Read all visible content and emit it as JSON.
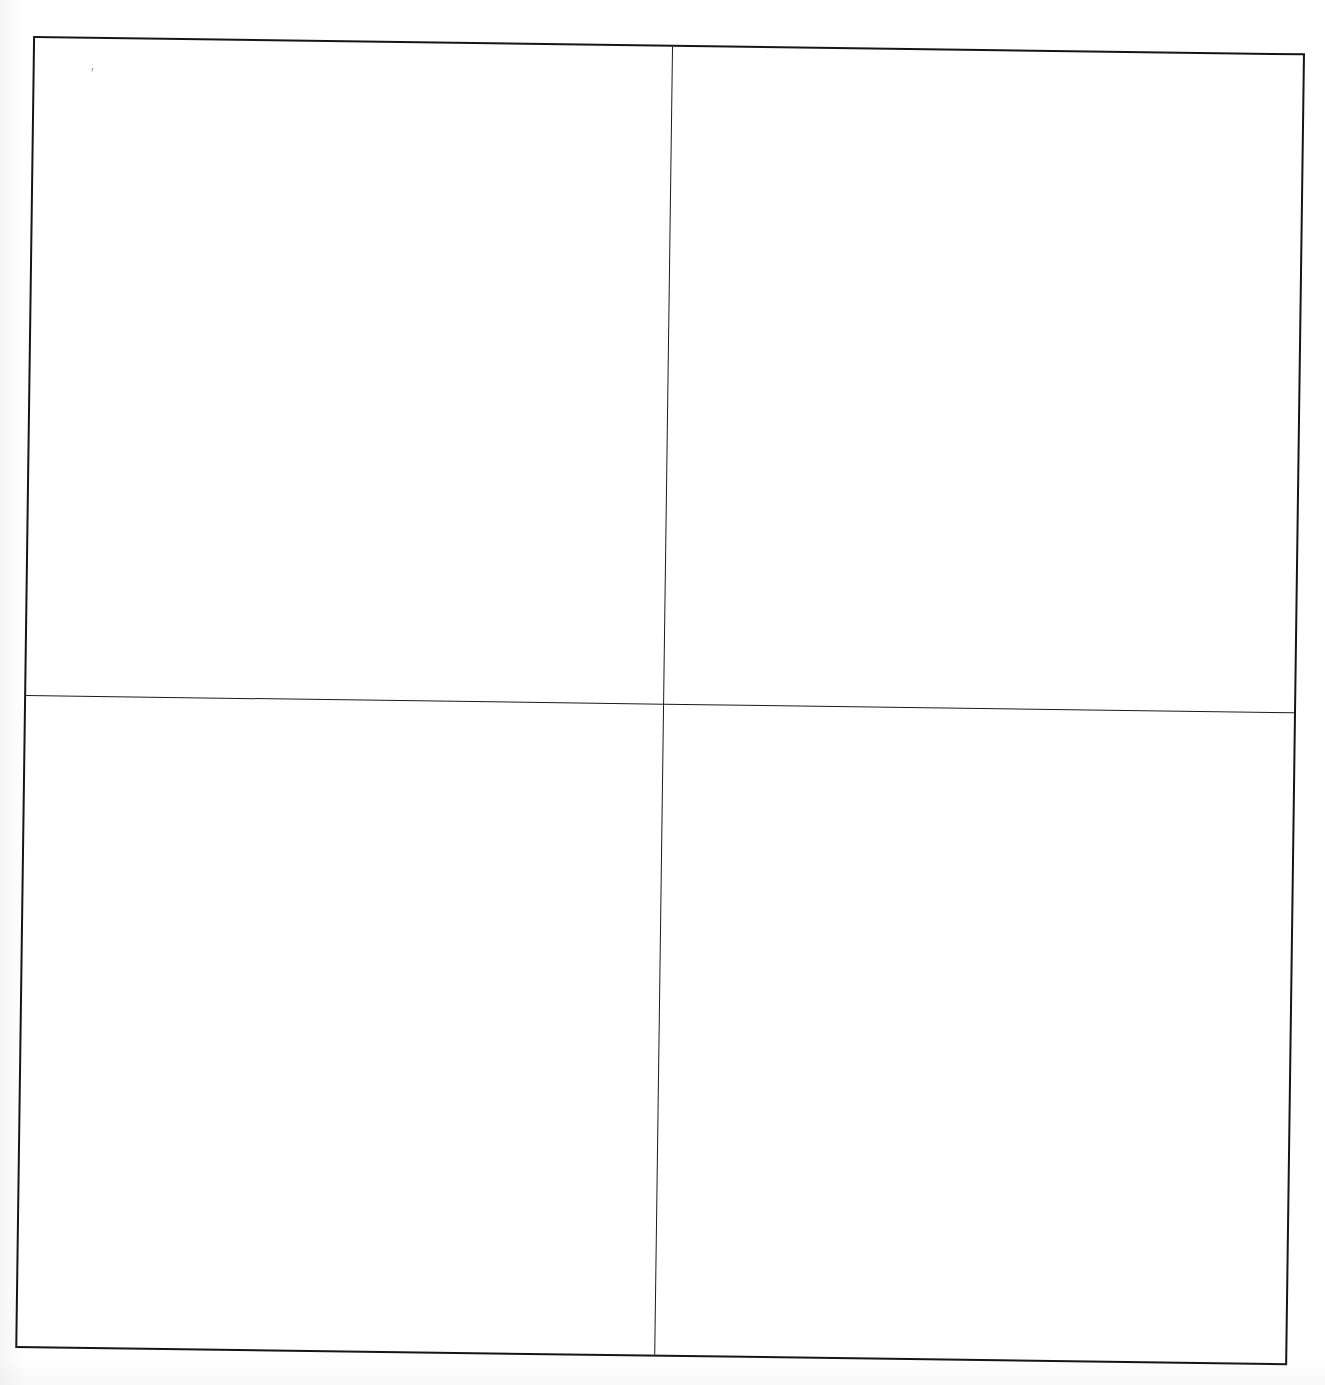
{
  "document": {
    "kind": "scanned-page",
    "background_color": "#ffffff",
    "ink_color": "#151515",
    "page_width": 1325,
    "page_height": 1385,
    "scan_rotation_degrees": 0.78
  },
  "title_remnant": {
    "text": "",
    "note": "clipped/illegible text line cut off at top edge of scan"
  },
  "grid": {
    "name": "empty-2x2-table",
    "columns": 2,
    "rows": 2,
    "border_color": "#151515",
    "divider_color": "#1b1b1b",
    "cells": [
      {
        "id": "r0c0",
        "text": ""
      },
      {
        "id": "r0c1",
        "text": ""
      },
      {
        "id": "r1c0",
        "text": ""
      },
      {
        "id": "r1c1",
        "text": ""
      }
    ]
  },
  "marks": {
    "ink_speck": "'"
  }
}
